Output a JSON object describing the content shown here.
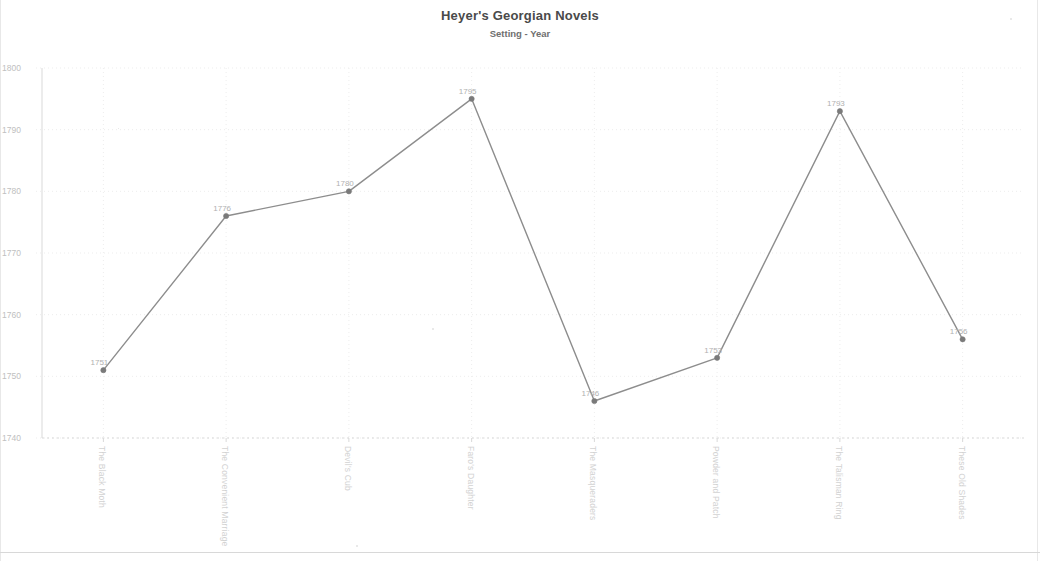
{
  "chart_data": {
    "type": "line",
    "title": "Heyer's Georgian Novels",
    "subtitle": "Setting - Year",
    "xlabel": "",
    "ylabel": "",
    "ylim": [
      1740,
      1800
    ],
    "yticks": [
      1740,
      1750,
      1760,
      1770,
      1780,
      1790,
      1800
    ],
    "grid": true,
    "legend": null,
    "categories": [
      "The Black Moth",
      "The Convenient Marriage",
      "Devil's Cub",
      "Faro's Daughter",
      "The Masqueraders",
      "Powder and Patch",
      "The Talisman Ring",
      "These Old Shades"
    ],
    "values": [
      1751,
      1776,
      1780,
      1795,
      1746,
      1753,
      1793,
      1756
    ],
    "point_labels": [
      "1751",
      "1776",
      "1780",
      "1795",
      "1746",
      "1753",
      "1793",
      "1756"
    ],
    "series": [
      {
        "name": "Setting - Year",
        "values": [
          1751,
          1776,
          1780,
          1795,
          1746,
          1753,
          1793,
          1756
        ]
      }
    ]
  },
  "axis": {
    "y_tick_labels": [
      "1800",
      "1790",
      "1780",
      "1770",
      "1760",
      "1750",
      "1740"
    ],
    "x_tick_labels": [
      "The Black Moth",
      "The Convenient Marriage",
      "Devil's Cub",
      "Faro's Daughter",
      "The Masqueraders",
      "Powder and Patch",
      "The Talisman Ring",
      "These Old Shades"
    ]
  },
  "style": {
    "line_color": "#8d8d8d",
    "marker_color": "#7a7a7a",
    "grid_color": "#ededed",
    "axis_color": "#d9d9d9",
    "title_color": "#4a4a4a",
    "label_color": "#c0c0c0",
    "background": "#ffffff"
  }
}
